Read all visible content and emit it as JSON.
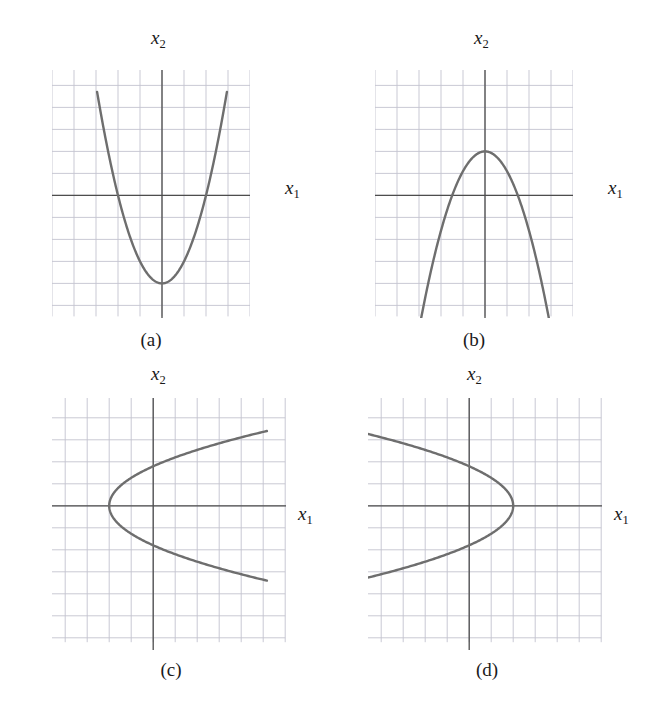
{
  "figure": {
    "background_color": "#ffffff",
    "grid_color": "#c3c3cf",
    "axis_color": "#4d4d4d",
    "curve_color": "#6e6e6e",
    "text_color": "#1a1a1a",
    "footer_text": ""
  },
  "labels": {
    "x_axis": "x",
    "x_axis_sub": "1",
    "y_axis": "x",
    "y_axis_sub": "2"
  },
  "panels": [
    {
      "id": "a",
      "caption": "(a)",
      "x_axis_label": "x",
      "x_axis_sub": "1",
      "y_axis_label": "x",
      "y_axis_sub": "2"
    },
    {
      "id": "b",
      "caption": "(b)",
      "x_axis_label": "x",
      "x_axis_sub": "1",
      "y_axis_label": "x",
      "y_axis_sub": "2"
    },
    {
      "id": "c",
      "caption": "(c)",
      "x_axis_label": "x",
      "x_axis_sub": "1",
      "y_axis_label": "x",
      "y_axis_sub": "2"
    },
    {
      "id": "d",
      "caption": "(d)",
      "x_axis_label": "x",
      "x_axis_sub": "1",
      "y_axis_label": "x",
      "y_axis_sub": "2"
    }
  ],
  "chart_data": [
    {
      "id": "a",
      "type": "line",
      "title": "(a)",
      "xlabel": "x1",
      "ylabel": "x2",
      "grid": true,
      "legend": "none",
      "xlim": [
        -4,
        5
      ],
      "ylim": [
        -6,
        5
      ],
      "curve": {
        "form": "x2 = a*x1^2 + c",
        "orientation": "opens-up",
        "vertex": [
          0,
          -4
        ],
        "a": 1.0,
        "c": -4,
        "x_roots": [
          -2,
          2
        ],
        "x_domain": [
          -2.95,
          2.95
        ]
      }
    },
    {
      "id": "b",
      "type": "line",
      "title": "(b)",
      "xlabel": "x1",
      "ylabel": "x2",
      "grid": true,
      "legend": "none",
      "xlim": [
        -4,
        5
      ],
      "ylim": [
        -6,
        5
      ],
      "curve": {
        "form": "x2 = a*x1^2 + c",
        "orientation": "opens-down",
        "vertex": [
          0,
          2
        ],
        "a": -0.9,
        "c": 2,
        "x_roots": [
          -1.49,
          1.49
        ],
        "x_domain": [
          -2.95,
          2.95
        ]
      }
    },
    {
      "id": "c",
      "type": "line",
      "title": "(c)",
      "xlabel": "x1",
      "ylabel": "x2",
      "grid": true,
      "legend": "none",
      "xlim": [
        -4,
        5
      ],
      "ylim": [
        -6,
        5
      ],
      "curve": {
        "form": "x1 = a*x2^2 + c",
        "orientation": "opens-right",
        "vertex": [
          -2,
          0
        ],
        "a": 0.62,
        "c": -2,
        "y_domain": [
          -3.4,
          3.4
        ]
      }
    },
    {
      "id": "d",
      "type": "line",
      "title": "(d)",
      "xlabel": "x1",
      "ylabel": "x2",
      "grid": true,
      "legend": "none",
      "xlim": [
        -4,
        5
      ],
      "ylim": [
        -6,
        5
      ],
      "curve": {
        "form": "x1 = a*x2^2 + c",
        "orientation": "opens-left",
        "vertex": [
          2,
          0
        ],
        "a": -0.62,
        "c": 2,
        "y_domain": [
          -3.4,
          3.4
        ]
      }
    }
  ]
}
